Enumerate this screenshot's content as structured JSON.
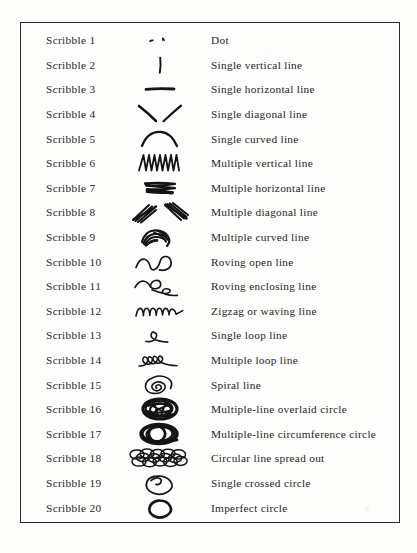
{
  "document": {
    "type": "reference-table",
    "border_color": "#2a2a2a",
    "ink_color": "#141414",
    "paper_color": "#fdfdfc",
    "columns": [
      "label",
      "scribble",
      "description"
    ]
  },
  "rows": [
    {
      "label": "Scribble 1",
      "glyph": "dot",
      "description": "Dot"
    },
    {
      "label": "Scribble 2",
      "glyph": "single-vertical-line",
      "description": "Single vertical line"
    },
    {
      "label": "Scribble 3",
      "glyph": "single-horizontal-line",
      "description": "Single horizontal line"
    },
    {
      "label": "Scribble 4",
      "glyph": "single-diagonal-line",
      "description": "Single diagonal line"
    },
    {
      "label": "Scribble 5",
      "glyph": "single-curved-line",
      "description": "Single curved line"
    },
    {
      "label": "Scribble 6",
      "glyph": "multiple-vertical-line",
      "description": "Multiple vertical line"
    },
    {
      "label": "Scribble 7",
      "glyph": "multiple-horizontal-line",
      "description": "Multiple horizontal line"
    },
    {
      "label": "Scribble 8",
      "glyph": "multiple-diagonal-line",
      "description": "Multiple diagonal line"
    },
    {
      "label": "Scribble 9",
      "glyph": "multiple-curved-line",
      "description": "Multiple curved line"
    },
    {
      "label": "Scribble 10",
      "glyph": "roving-open-line",
      "description": "Roving open line"
    },
    {
      "label": "Scribble 11",
      "glyph": "roving-enclosing-line",
      "description": "Roving enclosing line"
    },
    {
      "label": "Scribble 12",
      "glyph": "zigzag-waving-line",
      "description": "Zigzag or waving line"
    },
    {
      "label": "Scribble 13",
      "glyph": "single-loop-line",
      "description": "Single loop line"
    },
    {
      "label": "Scribble 14",
      "glyph": "multiple-loop-line",
      "description": "Multiple loop line"
    },
    {
      "label": "Scribble 15",
      "glyph": "spiral-line",
      "description": "Spiral line"
    },
    {
      "label": "Scribble 16",
      "glyph": "multiple-line-overlaid-circle",
      "description": "Multiple-line overlaid circle"
    },
    {
      "label": "Scribble 17",
      "glyph": "multiple-line-circumference-circle",
      "description": "Multiple-line circumference circle"
    },
    {
      "label": "Scribble 18",
      "glyph": "circular-line-spread-out",
      "description": "Circular line spread out"
    },
    {
      "label": "Scribble 19",
      "glyph": "single-crossed-circle",
      "description": "Single crossed circle"
    },
    {
      "label": "Scribble 20",
      "glyph": "imperfect-circle",
      "description": "Imperfect circle"
    }
  ]
}
